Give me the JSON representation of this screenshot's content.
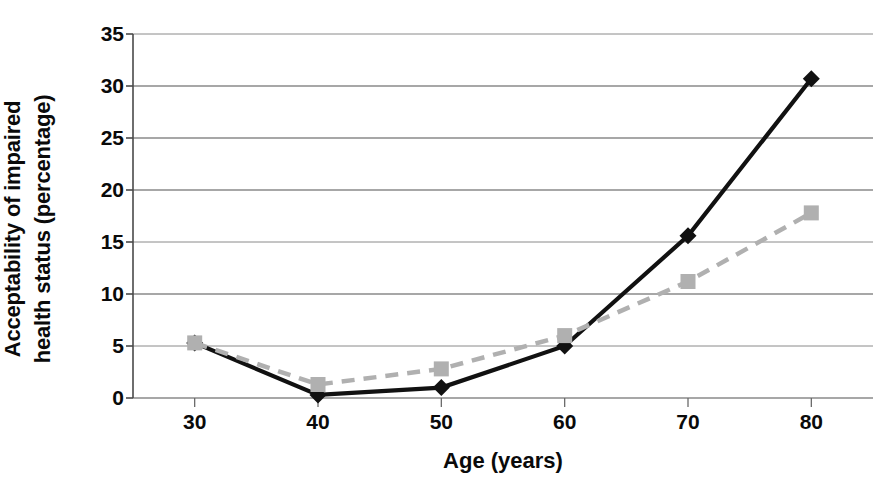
{
  "chart_data": {
    "type": "line",
    "title": "",
    "xlabel": "Age (years)",
    "ylabel": "Acceptability of impaired health status (percentage)",
    "ylabel_lines": [
      "Acceptability of impaired",
      "health status (percentage)"
    ],
    "x": [
      30,
      40,
      50,
      60,
      70,
      80
    ],
    "xtick_labels": [
      "30",
      "40",
      "50",
      "60",
      "70",
      "80"
    ],
    "ytick_labels": [
      "0",
      "5",
      "10",
      "15",
      "20",
      "25",
      "30",
      "35"
    ],
    "yticks": [
      0,
      5,
      10,
      15,
      20,
      25,
      30,
      35
    ],
    "xlim": [
      25,
      85
    ],
    "ylim": [
      0,
      35
    ],
    "grid": "horizontal",
    "legend": "none",
    "series": [
      {
        "name": "solid-black-diamond",
        "marker": "diamond",
        "linestyle": "solid",
        "color": "#111111",
        "values": [
          5.3,
          0.3,
          1.0,
          5.0,
          15.6,
          30.7
        ]
      },
      {
        "name": "dashed-gray-square",
        "marker": "square",
        "linestyle": "dashed",
        "color": "#b0b0b0",
        "values": [
          5.3,
          1.3,
          2.8,
          6.0,
          11.2,
          17.8
        ]
      }
    ]
  },
  "axis": {
    "x_title": "Age (years)",
    "y_title_line1": "Acceptability of impaired",
    "y_title_line2": "health status (percentage)"
  }
}
